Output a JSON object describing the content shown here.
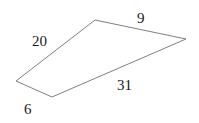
{
  "figure": {
    "type": "quadrilateral",
    "background_color": "#ffffff",
    "stroke_color": "#808080",
    "stroke_width": 1,
    "label_color": "#1a1a1a",
    "canvas": {
      "width": 199,
      "height": 123
    },
    "vertices": [
      {
        "name": "left-vertex",
        "x": 16,
        "y": 81
      },
      {
        "name": "top-vertex",
        "x": 95,
        "y": 20
      },
      {
        "name": "right-vertex",
        "x": 186,
        "y": 39
      },
      {
        "name": "bottom-vertex",
        "x": 52,
        "y": 97
      }
    ],
    "path": "M 16 81 L 95 20 L 186 39 L 52 97 Z",
    "edges": [
      {
        "name": "left-edge",
        "label": "20",
        "from": "left-vertex",
        "to": "top-vertex"
      },
      {
        "name": "top-edge",
        "label": "9",
        "from": "top-vertex",
        "to": "right-vertex"
      },
      {
        "name": "long-edge",
        "label": "31",
        "from": "right-vertex",
        "to": "bottom-vertex"
      },
      {
        "name": "bottom-edge",
        "label": "6",
        "from": "bottom-vertex",
        "to": "left-vertex"
      }
    ]
  }
}
